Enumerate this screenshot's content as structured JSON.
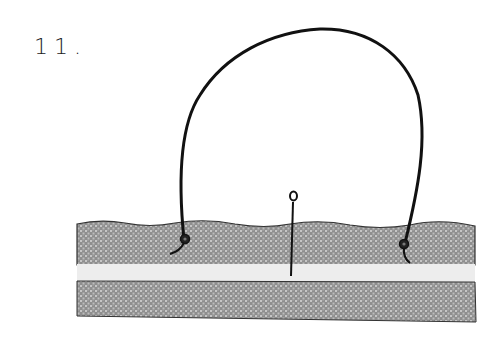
{
  "step": {
    "number": "11."
  },
  "illustration": {
    "description": "Wire loop anchored in top fabric layer with a pin inserted through the center",
    "colors": {
      "fabric": "#8c8c8c",
      "fabric_light": "#c4c4c4",
      "gap_strip": "#efefef",
      "ink": "#111111",
      "background": "#ffffff"
    },
    "elements": [
      "wire-loop",
      "left-anchor-knot",
      "right-anchor-knot",
      "center-pin",
      "top-fabric-layer",
      "gap-strip",
      "bottom-fabric-layer"
    ]
  }
}
